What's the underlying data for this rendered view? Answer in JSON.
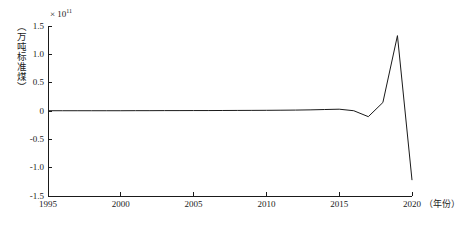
{
  "chart_data": {
    "type": "line",
    "title": "",
    "xlabel": "（年份）",
    "ylabel": "（万吨标准煤）",
    "exponent_prefix": "× 10",
    "exponent_value": "11",
    "xlim": [
      1995,
      2020
    ],
    "ylim": [
      -1.5,
      1.5
    ],
    "grid": false,
    "legend": null,
    "xticks": [
      "1995",
      "2000",
      "2005",
      "2010",
      "2015",
      "2020"
    ],
    "xtick_values": [
      1995,
      2000,
      2005,
      2010,
      2015,
      2020
    ],
    "yticks": [
      "1.5",
      "1.0",
      "0.5",
      "0",
      "-0.5",
      "-1.0",
      "-1.5"
    ],
    "ytick_values": [
      1.5,
      1.0,
      0.5,
      0,
      -0.5,
      -1.0,
      -1.5
    ],
    "x": [
      1995,
      1996,
      1997,
      1998,
      1999,
      2000,
      2001,
      2002,
      2003,
      2004,
      2005,
      2006,
      2007,
      2008,
      2009,
      2010,
      2011,
      2012,
      2013,
      2014,
      2015,
      2016,
      2017,
      2018,
      2019,
      2020
    ],
    "values": [
      0.005,
      0.005,
      0.005,
      0.005,
      0.005,
      0.005,
      0.006,
      0.006,
      0.007,
      0.007,
      0.008,
      0.008,
      0.009,
      0.01,
      0.011,
      0.012,
      0.014,
      0.016,
      0.02,
      0.026,
      0.032,
      0.005,
      -0.1,
      0.15,
      1.33,
      -1.22
    ],
    "series": [
      {
        "name": "",
        "values": [
          0.005,
          0.005,
          0.005,
          0.005,
          0.005,
          0.005,
          0.006,
          0.006,
          0.007,
          0.007,
          0.008,
          0.008,
          0.009,
          0.01,
          0.011,
          0.012,
          0.014,
          0.016,
          0.02,
          0.026,
          0.032,
          0.005,
          -0.1,
          0.15,
          1.33,
          -1.22
        ],
        "color": "#1a1a1a"
      }
    ]
  }
}
